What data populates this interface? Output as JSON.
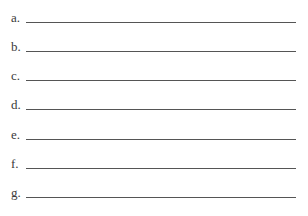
{
  "blanks": [
    {
      "label": "a.",
      "value": ""
    },
    {
      "label": "b.",
      "value": ""
    },
    {
      "label": "c.",
      "value": ""
    },
    {
      "label": "d.",
      "value": ""
    },
    {
      "label": "e.",
      "value": ""
    },
    {
      "label": "f.",
      "value": ""
    },
    {
      "label": "g.",
      "value": ""
    }
  ]
}
